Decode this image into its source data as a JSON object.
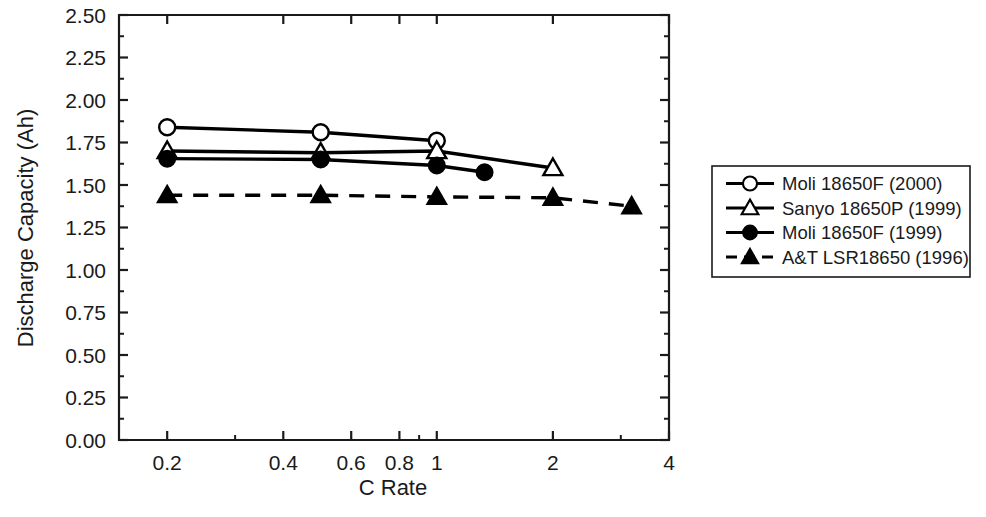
{
  "chart_data": {
    "type": "line",
    "title": "",
    "subtitle": "",
    "xlabel": "C Rate",
    "ylabel": "Discharge Capacity (Ah)",
    "xscale": "log",
    "yscale": "linear",
    "xlim": [
      0.15,
      4
    ],
    "ylim": [
      0.0,
      2.5
    ],
    "xticks": [
      0.2,
      0.4,
      0.6,
      0.8,
      1,
      2,
      4
    ],
    "xticklabels": [
      "0.2",
      "0.4",
      "0.6",
      "0.8",
      "1",
      "2",
      "4"
    ],
    "yticks": [
      0.0,
      0.25,
      0.5,
      0.75,
      1.0,
      1.25,
      1.5,
      1.75,
      2.0,
      2.25,
      2.5
    ],
    "yticklabels": [
      "0.00",
      "0.25",
      "0.50",
      "0.75",
      "1.00",
      "1.25",
      "1.50",
      "1.75",
      "2.00",
      "2.25",
      "2.50"
    ],
    "grid": false,
    "legend_position": "right-outside",
    "series": [
      {
        "name": "Moli 18650F (2000)",
        "marker": "open-circle",
        "linestyle": "solid",
        "color": "#000000",
        "x": [
          0.2,
          0.5,
          1.0
        ],
        "y": [
          1.84,
          1.81,
          1.76
        ]
      },
      {
        "name": "Sanyo 18650P (1999)",
        "marker": "open-triangle",
        "linestyle": "solid",
        "color": "#000000",
        "x": [
          0.2,
          0.5,
          1.0,
          2.0
        ],
        "y": [
          1.7,
          1.69,
          1.7,
          1.6
        ]
      },
      {
        "name": "Moli 18650F (1999)",
        "marker": "filled-circle",
        "linestyle": "solid",
        "color": "#000000",
        "x": [
          0.2,
          0.5,
          1.0,
          1.33
        ],
        "y": [
          1.655,
          1.65,
          1.615,
          1.575
        ]
      },
      {
        "name": "A&T LSR18650 (1996)",
        "marker": "filled-triangle",
        "linestyle": "dashed",
        "color": "#000000",
        "x": [
          0.2,
          0.5,
          1.0,
          2.0,
          3.2
        ],
        "y": [
          1.44,
          1.44,
          1.43,
          1.425,
          1.375
        ]
      }
    ]
  },
  "legend": {
    "items": [
      {
        "label": "Moli 18650F (2000)",
        "marker": "open-circle",
        "linestyle": "solid"
      },
      {
        "label": "Sanyo 18650P (1999)",
        "marker": "open-triangle",
        "linestyle": "solid"
      },
      {
        "label": "Moli 18650F (1999)",
        "marker": "filled-circle",
        "linestyle": "solid"
      },
      {
        "label": "A&T LSR18650 (1996)",
        "marker": "filled-triangle",
        "linestyle": "dashed"
      }
    ]
  },
  "axes": {
    "x_title": "C Rate",
    "y_title": "Discharge Capacity (Ah)"
  },
  "colors": {
    "ink": "#1a1a1a",
    "series": "#000000",
    "background": "#ffffff"
  }
}
